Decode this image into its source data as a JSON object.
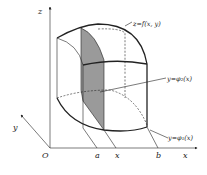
{
  "figure": {
    "type": "3d-solid-region-diagram"
  },
  "axes": {
    "origin_label": "O",
    "x_label": "x",
    "y_label": "y",
    "z_label": "z"
  },
  "ticks": {
    "a": "a",
    "x": "x",
    "b": "b"
  },
  "annotations": {
    "surface": "z=f(x, y)",
    "upper_curve": "y=φ₂(x)",
    "lower_curve": "y=φ₁(x)"
  },
  "colors": {
    "line": "#222222",
    "slice_fill": "#9a9a9a",
    "background": "#ffffff"
  }
}
